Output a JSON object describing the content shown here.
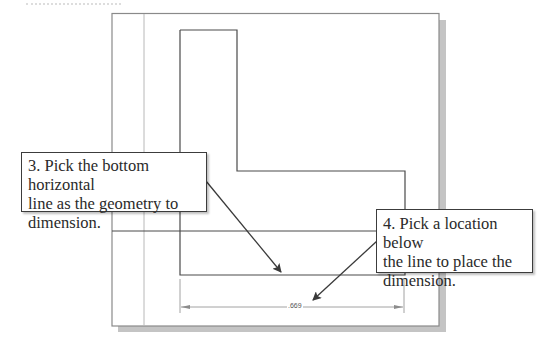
{
  "figure": {
    "type": "cad-dimension-instruction",
    "drawing": {
      "dimension_value": ".669"
    },
    "callouts": [
      {
        "step": "3",
        "text": "3. Pick the bottom horizontal line as the geometry to dimension.",
        "lines": [
          "3. Pick the bottom horizontal",
          "line as the geometry to",
          "dimension."
        ]
      },
      {
        "step": "4",
        "text": "4. Pick a location below the line to place the dimension.",
        "lines": [
          "4. Pick a location below",
          "the line to place the",
          "dimension."
        ]
      }
    ],
    "colors": {
      "frame": "#8a8a8a",
      "shadow": "#c4c4c4",
      "geometry": "#4a4a4a",
      "reference_line": "#b8b8b8",
      "callout_border": "#3c3c3c",
      "arrow": "#3a3a3a",
      "dimension": "#8c8c8c"
    }
  }
}
